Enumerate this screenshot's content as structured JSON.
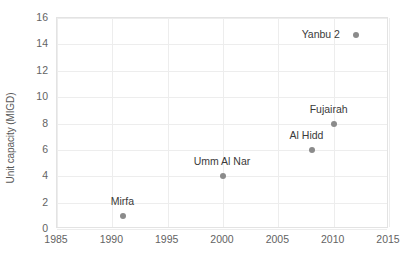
{
  "chart_data": {
    "type": "scatter",
    "title": "",
    "xlabel": "",
    "ylabel": "Unit capacity (MIGD)",
    "xlim": [
      1985,
      2015
    ],
    "ylim": [
      0,
      16
    ],
    "xticks": [
      1985,
      1990,
      1995,
      2000,
      2005,
      2010,
      2015
    ],
    "yticks": [
      0,
      2,
      4,
      6,
      8,
      10,
      12,
      14,
      16
    ],
    "grid": true,
    "legend": "none",
    "marker_color": "#8b8b8b",
    "gridline_color": "#ededed",
    "axis_text_color": "#636363",
    "label_text_color": "#3a3a3a",
    "points": [
      {
        "name": "Mirfa",
        "x": 1991,
        "y": 1.0,
        "label_dx": 0,
        "label_dy": -14
      },
      {
        "name": "Umm Al Nar",
        "x": 2000,
        "y": 4.0,
        "label_dx": 0,
        "label_dy": -14
      },
      {
        "name": "Al Hidd",
        "x": 2008,
        "y": 6.0,
        "label_dx": -4,
        "label_dy": -14
      },
      {
        "name": "Fujairah",
        "x": 2010,
        "y": 8.0,
        "label_dx": -4,
        "label_dy": -14
      },
      {
        "name": "Yanbu 2",
        "x": 2012,
        "y": 14.7,
        "label_dx": -34,
        "label_dy": 0
      }
    ]
  }
}
